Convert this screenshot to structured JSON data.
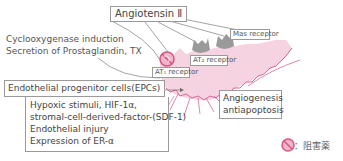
{
  "diagram": {
    "angiotensin": "Angiotensin Ⅱ",
    "cox": {
      "line1": "Cyclooxygenase induction",
      "line2": "Secretion of Prostaglandin, TX"
    },
    "mas_receptor": "Mas receptor",
    "at2_receptor": "AT₂ receptor",
    "at1_receptor": "AT₁ receptor",
    "epc": "Endothelial progenitor cells(EPCs)",
    "stimuli": {
      "line1": "Hypoxic stimuli, HIF-1α,",
      "line2": " stromal-cell-derived-factor-(SDF-1)",
      "line3": "Endothelial injury",
      "line4": "Expression of ER-α"
    },
    "angiogenesis": {
      "line1": "Angiogenesis",
      "line2": "antiapoptosis"
    },
    "legend": {
      "icon": "prohibition-icon",
      "label": "：阻害薬"
    },
    "colors": {
      "cell_fill": "#f6d3e1",
      "cell_stroke": "#d7679a",
      "receptor": "#9a9a9a",
      "inhibitor": "#d9567f",
      "box_border": "#9a9a9a"
    }
  }
}
